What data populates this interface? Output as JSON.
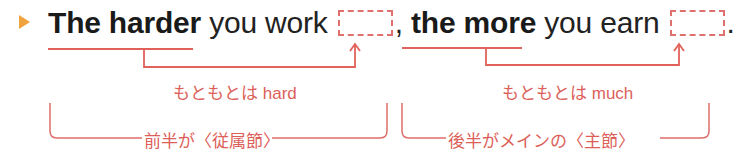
{
  "bullet": {
    "icon": "triangle-marker-icon",
    "color": "#f0a33c"
  },
  "sentence": {
    "part1_bold": "The harder",
    "part1_rest": " you work ",
    "comma": ",",
    "part2_bold": "the more",
    "part2_rest": " you earn ",
    "period": "."
  },
  "annotations": {
    "note1": "もともとは hard",
    "note2": "もともとは much",
    "clause1": "前半が〈従属節〉",
    "clause2": "後半がメインの〈主節〉"
  },
  "colors": {
    "annotation": "#dc5f5a",
    "line": "#e0625a",
    "text": "#222222"
  }
}
